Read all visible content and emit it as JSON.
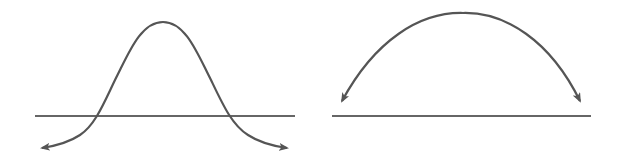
{
  "colors": {
    "background": "#ffffff",
    "curve": "#555555",
    "baseline": "#333333"
  },
  "diagrams": [
    {
      "id": "bell-curve-diagram",
      "description": "Bell-shaped curve crossing a horizontal baseline, with arrowheads pointing down-outward at both ends",
      "baseline": {
        "x1": 35,
        "y1": 116,
        "x2": 295,
        "y2": 116
      },
      "peak": {
        "x": 163,
        "y": 22
      },
      "crossings": [
        {
          "x": 92,
          "y": 116
        },
        {
          "x": 237,
          "y": 116
        }
      ],
      "arrow_tips": [
        {
          "x": 42,
          "y": 148
        },
        {
          "x": 287,
          "y": 148
        }
      ]
    },
    {
      "id": "arc-diagram",
      "description": "Semicircular arc above a horizontal baseline, with arrowheads at both ends pointing down toward the baseline",
      "baseline": {
        "x1": 332,
        "y1": 116,
        "x2": 591,
        "y2": 116
      },
      "apex": {
        "x": 463,
        "y": 13
      },
      "arrow_tips": [
        {
          "x": 342,
          "y": 101
        },
        {
          "x": 580,
          "y": 101
        }
      ]
    }
  ]
}
